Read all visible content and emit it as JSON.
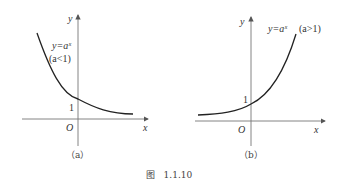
{
  "figure": {
    "caption": "图   1.1.10",
    "panels": [
      {
        "id": "a",
        "label": "（a）",
        "equation": "y=aˣ",
        "condition": "(a<1)",
        "axis_x": "x",
        "axis_y": "y",
        "origin": "O",
        "intercept": "1"
      },
      {
        "id": "b",
        "label": "（b）",
        "equation": "y=aˣ",
        "condition": "(a>1)",
        "axis_x": "x",
        "axis_y": "y",
        "origin": "O",
        "intercept": "1"
      }
    ]
  }
}
